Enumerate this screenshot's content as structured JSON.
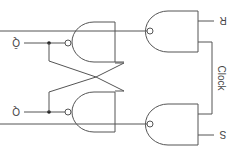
{
  "diagram": {
    "labels": {
      "q_bar": "Q̄",
      "q": "Q",
      "r": "R",
      "s": "S",
      "clock": "Clock"
    },
    "colors": {
      "line": "#555555",
      "text": "#444444",
      "background": "#ffffff"
    }
  }
}
